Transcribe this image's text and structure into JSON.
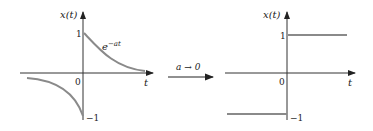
{
  "left_plot": {
    "y_axis_label": "x(t)",
    "x_axis_label": "t",
    "origin_label": "0",
    "tick_pos_label": "1",
    "tick_neg_label": "−1",
    "curve_label_base": "e",
    "curve_label_exp": "−at"
  },
  "transition": {
    "label": "a → 0"
  },
  "right_plot": {
    "y_axis_label": "x(t)",
    "x_axis_label": "t",
    "origin_label": "0",
    "tick_pos_label": "1",
    "tick_neg_label": "−1"
  },
  "colors": {
    "axis": "#333333",
    "curve": "#8a8a8a"
  }
}
